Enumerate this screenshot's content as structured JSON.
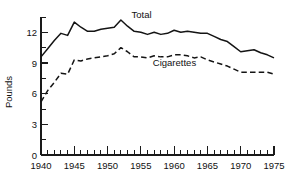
{
  "chart_data": {
    "type": "line",
    "title": "",
    "xlabel": "",
    "ylabel": "Pounds",
    "xlim": [
      1940,
      1975
    ],
    "ylim": [
      0,
      13.5
    ],
    "grid": false,
    "legend_position": "inline-annotation",
    "y_ticks": [
      0,
      3,
      6,
      9,
      12
    ],
    "y_tick_labels": [
      "0",
      "3",
      "6",
      "9",
      "12"
    ],
    "y_minor_tick_step": 1.5,
    "x_ticks": [
      1940,
      1945,
      1950,
      1955,
      1960,
      1965,
      1970,
      1975
    ],
    "x_tick_labels": [
      "1940",
      "1945",
      "1950",
      "1955",
      "1960",
      "1965",
      "1970",
      "1975"
    ],
    "x_minor_tick_step": 1,
    "x": [
      1940,
      1941,
      1942,
      1943,
      1944,
      1945,
      1946,
      1947,
      1948,
      1949,
      1950,
      1951,
      1952,
      1953,
      1954,
      1955,
      1956,
      1957,
      1958,
      1959,
      1960,
      1961,
      1962,
      1963,
      1964,
      1965,
      1966,
      1967,
      1968,
      1969,
      1970,
      1971,
      1972,
      1973,
      1974,
      1975
    ],
    "series": [
      {
        "name": "Total",
        "style": "solid",
        "color": "#141414",
        "values": [
          9.6,
          10.4,
          11.2,
          11.9,
          11.7,
          13.0,
          12.5,
          12.1,
          12.1,
          12.3,
          12.4,
          12.5,
          13.2,
          12.6,
          12.1,
          12.0,
          11.8,
          12.0,
          11.8,
          11.9,
          12.2,
          12.0,
          12.1,
          12.0,
          11.9,
          11.9,
          11.6,
          11.3,
          11.1,
          10.6,
          10.1,
          10.2,
          10.3,
          10.0,
          9.8,
          9.5
        ]
      },
      {
        "name": "Cigarettes",
        "style": "dashed",
        "color": "#141414",
        "values": [
          5.2,
          6.3,
          7.1,
          8.0,
          7.9,
          9.3,
          9.2,
          9.4,
          9.5,
          9.6,
          9.7,
          9.9,
          10.5,
          10.1,
          9.6,
          9.6,
          9.5,
          9.7,
          9.6,
          9.6,
          9.8,
          9.8,
          9.7,
          9.5,
          9.6,
          9.3,
          9.1,
          8.9,
          8.7,
          8.4,
          8.1,
          8.1,
          8.1,
          8.1,
          8.1,
          7.9
        ]
      }
    ],
    "annotations": [
      {
        "text": "Total",
        "x": 1953.6,
        "y": 13.4
      },
      {
        "text": "Cigarettes",
        "x": 1956.8,
        "y": 8.7
      }
    ]
  }
}
